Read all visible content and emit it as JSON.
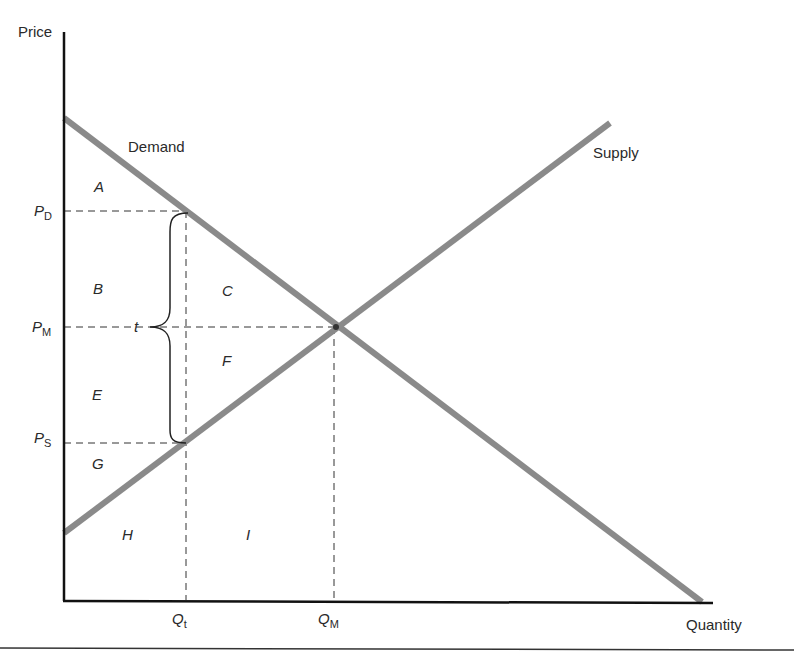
{
  "figure": {
    "axes": {
      "y_label": "Price",
      "x_label": "Quantity"
    },
    "curves": {
      "demand_label": "Demand",
      "supply_label": "Supply",
      "color": "#8a8a8a"
    },
    "price_levels": [
      {
        "symbol": "P",
        "subscript": "D"
      },
      {
        "symbol": "P",
        "subscript": "M"
      },
      {
        "symbol": "P",
        "subscript": "S"
      }
    ],
    "quantity_levels": [
      {
        "symbol": "Q",
        "subscript": "t"
      },
      {
        "symbol": "Q",
        "subscript": "M"
      }
    ],
    "tax_label": "t",
    "regions": [
      "A",
      "B",
      "C",
      "E",
      "F",
      "G",
      "H",
      "I"
    ]
  }
}
